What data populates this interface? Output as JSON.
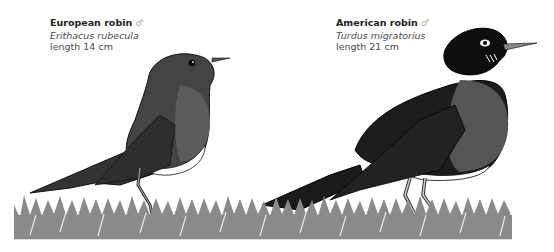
{
  "figure": {
    "colors": {
      "background": "#ffffff",
      "text": "#4a4a4a",
      "bird_dark": "#3a3a3a",
      "bird_black": "#141414",
      "breast_gray": "#5e5e5e",
      "belly_white": "#ffffff",
      "grass": "#8a8a8a"
    },
    "birds": [
      {
        "common_name": "European robin",
        "sex_symbol": "♂",
        "latin_name": "Erithacus rubecula",
        "length": "length 14 cm"
      },
      {
        "common_name": "American robin",
        "sex_symbol": "♂",
        "latin_name": "Turdus migratorius",
        "length": "length 21 cm"
      }
    ]
  }
}
